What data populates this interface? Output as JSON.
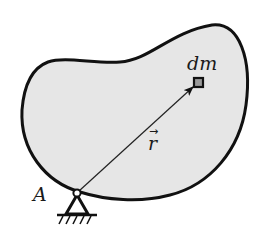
{
  "diagram": {
    "type": "rigid-body-mass-element",
    "body": {
      "fill": "#e6e6e6",
      "stroke": "#111111"
    },
    "labels": {
      "pivot": "A",
      "mass_element": "dm",
      "position_vector": "r",
      "position_vector_arrow": "→"
    },
    "elements": [
      {
        "id": "body",
        "kind": "closed-blob",
        "description": "irregular bean-shaped rigid body"
      },
      {
        "id": "pivot",
        "kind": "pin-support",
        "label": "A"
      },
      {
        "id": "mass-element",
        "kind": "small-square",
        "label": "dm"
      },
      {
        "id": "position-vector",
        "kind": "arrow",
        "from": "pivot",
        "to": "mass-element",
        "label": "r"
      }
    ]
  }
}
